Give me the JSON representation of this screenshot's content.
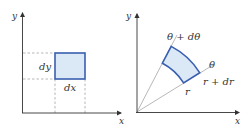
{
  "colors": {
    "axis": "#333333",
    "guide": "#999999",
    "region_stroke": "#3a5fb0",
    "region_fill": "#dbe9f7"
  },
  "cartesian": {
    "x_axis_label": "x",
    "y_axis_label": "y",
    "dx_label": "dx",
    "dy_label": "dy"
  },
  "polar": {
    "x_axis_label": "x",
    "y_axis_label": "y",
    "theta_label": "θ",
    "theta_dtheta_label": "θ + dθ",
    "r_label": "r",
    "r_dr_label": "r + dr"
  }
}
